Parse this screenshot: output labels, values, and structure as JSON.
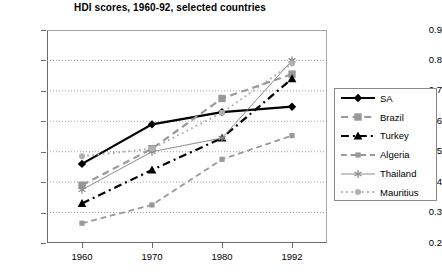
{
  "chart_data": {
    "type": "line",
    "title": "HDI scores, 1960-92, selected countries",
    "xlabel": "",
    "ylabel": "",
    "categories": [
      "1960",
      "1970",
      "1980",
      "1992"
    ],
    "x": [
      1960,
      1970,
      1980,
      1992
    ],
    "ylim": [
      0.2,
      0.9
    ],
    "yticks": [
      "0.2",
      "0.3",
      "0.4",
      "0.5",
      "0.6",
      "0.7",
      "0.8",
      "0.9"
    ],
    "ytick_values": [
      0.2,
      0.3,
      0.4,
      0.5,
      0.6,
      0.7,
      0.8,
      0.9
    ],
    "grid": "horizontal dotted",
    "legend_position": "right, outside plot",
    "series": [
      {
        "name": "SA",
        "values": [
          0.46,
          0.59,
          0.63,
          0.648
        ],
        "color": "#000000",
        "line_style": "solid",
        "line_width": 2.2,
        "marker": "diamond"
      },
      {
        "name": "Brazil",
        "values": [
          0.39,
          0.51,
          0.675,
          0.755
        ],
        "color": "#999999",
        "line_style": "dashed",
        "line_width": 2.2,
        "marker": "square"
      },
      {
        "name": "Turkey",
        "values": [
          0.33,
          0.44,
          0.545,
          0.74
        ],
        "color": "#000000",
        "line_style": "dash-dot",
        "line_width": 2.2,
        "marker": "triangle"
      },
      {
        "name": "Algeria",
        "values": [
          0.265,
          0.325,
          0.475,
          0.553
        ],
        "color": "#999999",
        "line_style": "dashed",
        "line_width": 1.8,
        "marker": "small-square"
      },
      {
        "name": "Thailand",
        "values": [
          0.375,
          0.5,
          0.545,
          0.8
        ],
        "color": "#8c8c8c",
        "line_style": "solid",
        "line_width": 1.0,
        "marker": "asterisk"
      },
      {
        "name": "Mauritius",
        "values": [
          0.485,
          0.51,
          0.628,
          0.79
        ],
        "color": "#b0b0b0",
        "line_style": "dotted",
        "line_width": 2.0,
        "marker": "circle"
      }
    ]
  },
  "legend": {
    "entries": [
      {
        "label": "SA"
      },
      {
        "label": "Brazil"
      },
      {
        "label": "Turkey"
      },
      {
        "label": "Algeria"
      },
      {
        "label": "Thailand"
      },
      {
        "label": "Mauritius"
      }
    ]
  }
}
